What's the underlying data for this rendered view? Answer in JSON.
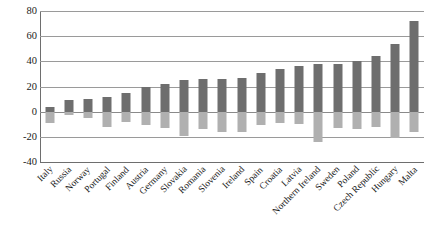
{
  "chart_data": {
    "type": "bar",
    "title": "",
    "subtitle": "",
    "xlabel": "",
    "ylabel": "",
    "ylim": [
      -40,
      80
    ],
    "yticks": [
      80,
      60,
      40,
      20,
      0,
      -20,
      -40
    ],
    "grid": true,
    "legend": "none",
    "orientation": "vertical",
    "categories": [
      "Italy",
      "Russia",
      "Norway",
      "Portugal",
      "Finland",
      "Austria",
      "Germany",
      "Slovakia",
      "Romania",
      "Slovenia",
      "Ireland",
      "Spain",
      "Croatia",
      "Latvia",
      "Northern Ireland",
      "Sweden",
      "Poland",
      "Czech Republic",
      "Hungary",
      "Malta"
    ],
    "series": [
      {
        "name": "positive",
        "color": "#6e6e6e",
        "values": [
          4,
          9,
          10,
          12,
          15,
          20,
          22,
          25,
          26,
          26,
          27,
          31,
          34,
          36,
          38,
          38,
          40,
          44,
          54,
          72
        ]
      },
      {
        "name": "negative",
        "color": "#b0b0b0",
        "values": [
          -9,
          -3,
          -5,
          -12,
          -8,
          -11,
          -13,
          -19,
          -14,
          -16,
          -16,
          -11,
          -9,
          -10,
          -24,
          -13,
          -14,
          -12,
          -21,
          -16
        ]
      }
    ]
  },
  "axis": {
    "y_tick_labels": [
      "80",
      "60",
      "40",
      "20",
      "0",
      "-20",
      "-40"
    ]
  }
}
